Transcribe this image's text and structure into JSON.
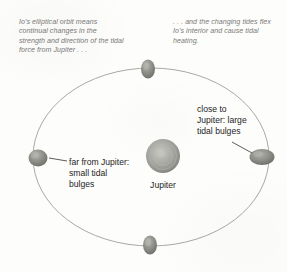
{
  "figure": {
    "title_caption_left": "Io's elliptical orbit means continual changes in the strength and direction of the tidal force from Jupiter . . .",
    "title_caption_right": ". . . and the changing tides flex Io's interior and cause tidal heating."
  },
  "labels": {
    "far": "far from Jupiter: small tidal bulges",
    "close": "close to Jupiter: large tidal bulges",
    "jupiter": "Jupiter"
  },
  "colors": {
    "background": "#fdfdfc",
    "caption_text": "#7b7b78",
    "label_text": "#1d1d1d",
    "orbit_line": "#a9a8a4",
    "leader_line": "#4a4a48",
    "jupiter_body": "#9d9d99",
    "io_body": "#8e8e8a"
  },
  "diagram_data": {
    "type": "orbital-diagram",
    "subject": "Io tidal heating around Jupiter",
    "orbit": {
      "shape": "ellipse",
      "center_px": [
        151,
        157
      ],
      "radius_x_px": 118,
      "radius_y_px": 89
    },
    "central_body": {
      "name": "Jupiter",
      "center_px": [
        163,
        156
      ],
      "diameter_px": 34
    },
    "moons": [
      {
        "name": "Io",
        "position": "top",
        "center_px": [
          148,
          69
        ],
        "width_px": 14,
        "height_px": 19,
        "bulge": "vertical"
      },
      {
        "name": "Io",
        "position": "right",
        "center_px": [
          262,
          157
        ],
        "width_px": 25,
        "height_px": 16,
        "bulge": "large-horizontal"
      },
      {
        "name": "Io",
        "position": "bottom",
        "center_px": [
          150,
          245
        ],
        "width_px": 14,
        "height_px": 19,
        "bulge": "vertical"
      },
      {
        "name": "Io",
        "position": "left",
        "center_px": [
          38,
          158
        ],
        "width_px": 19,
        "height_px": 17,
        "bulge": "small-round"
      }
    ],
    "annotations": [
      {
        "text": "far from Jupiter: small tidal bulges",
        "points_to": "left-moon"
      },
      {
        "text": "close to Jupiter: large tidal bulges",
        "points_to": "right-moon"
      }
    ]
  }
}
